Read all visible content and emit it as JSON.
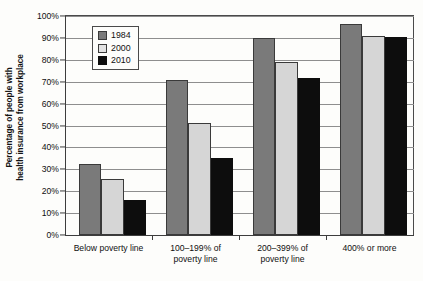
{
  "chart_data": {
    "type": "bar",
    "title": "",
    "xlabel": "",
    "ylabel": "Percentage of people with health insurance from workplace",
    "ylabel_line1": "Percentage of people with",
    "ylabel_line2": "health insurance from workplace",
    "ylim": [
      0,
      100
    ],
    "ytick_labels": [
      "0%",
      "10%",
      "20%",
      "30%",
      "40%",
      "50%",
      "60%",
      "70%",
      "80%",
      "90%",
      "100%"
    ],
    "ytick_values": [
      0,
      10,
      20,
      30,
      40,
      50,
      60,
      70,
      80,
      90,
      100
    ],
    "grid": true,
    "legend_position": "upper-left-inside",
    "categories": [
      "Below poverty line",
      "100–199% of poverty line",
      "200–399% of poverty line",
      "400% or more"
    ],
    "category_lines": [
      [
        "Below poverty line",
        ""
      ],
      [
        "100–199% of",
        "poverty line"
      ],
      [
        "200–399% of",
        "poverty line"
      ],
      [
        "400% or more",
        ""
      ]
    ],
    "series": [
      {
        "name": "1984",
        "color": "#7a7a7a",
        "values": [
          32.5,
          71.0,
          90.0,
          96.5
        ]
      },
      {
        "name": "2000",
        "color": "#d6d6d6",
        "values": [
          25.5,
          51.0,
          79.0,
          91.0
        ]
      },
      {
        "name": "2010",
        "color": "#0d0d0d",
        "values": [
          16.0,
          35.0,
          71.5,
          90.5
        ]
      }
    ]
  },
  "legend": {
    "items": [
      {
        "label": "1984"
      },
      {
        "label": "2000"
      },
      {
        "label": "2010"
      }
    ]
  }
}
